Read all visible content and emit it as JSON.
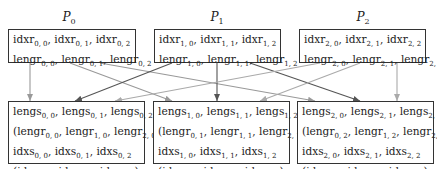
{
  "processes": [
    {
      "name": "P",
      "sub": "0",
      "top_lines": [
        [
          [
            "idxr",
            "0, 0"
          ],
          [
            "idxr",
            "0, 1"
          ],
          [
            "idxr",
            "0, 2"
          ]
        ],
        [
          [
            "lengr",
            "0, 0"
          ],
          [
            "lengr",
            "0, 1"
          ],
          [
            "lengr",
            "0, 2"
          ]
        ]
      ],
      "bottom_lines": [
        {
          "paren": false,
          "items": [
            [
              "lengs",
              "0, 0"
            ],
            [
              "lengs",
              "0, 1"
            ],
            [
              "lengs",
              "0, 2"
            ]
          ]
        },
        {
          "paren": true,
          "items": [
            [
              "lengr",
              "0, 0"
            ],
            [
              "lengr",
              "1, 0"
            ],
            [
              "lengr",
              "2, 0"
            ]
          ]
        },
        {
          "paren": false,
          "items": [
            [
              "idxs",
              "0, 0"
            ],
            [
              "idxs",
              "0, 1"
            ],
            [
              "idxs",
              "0, 2"
            ]
          ]
        },
        {
          "paren": true,
          "items": [
            [
              "idxr",
              "0, 0"
            ],
            [
              "idxr",
              "1, 0"
            ],
            [
              "idxr",
              "2, 0"
            ]
          ]
        }
      ]
    },
    {
      "name": "P",
      "sub": "1",
      "top_lines": [
        [
          [
            "idxr",
            "1, 0"
          ],
          [
            "idxr",
            "1, 1"
          ],
          [
            "idxr",
            "1, 2"
          ]
        ],
        [
          [
            "lengr",
            "1, 0"
          ],
          [
            "lengr",
            "1, 1"
          ],
          [
            "lengr",
            "1, 2"
          ]
        ]
      ],
      "bottom_lines": [
        {
          "paren": false,
          "items": [
            [
              "lengs",
              "1, 0"
            ],
            [
              "lengs",
              "1, 1"
            ],
            [
              "lengs",
              "1, 2"
            ]
          ]
        },
        {
          "paren": true,
          "items": [
            [
              "lengr",
              "0, 1"
            ],
            [
              "lengr",
              "1, 1"
            ],
            [
              "lengr",
              "2, 1"
            ]
          ]
        },
        {
          "paren": false,
          "items": [
            [
              "idxs",
              "1, 0"
            ],
            [
              "idxs",
              "1, 1"
            ],
            [
              "idxs",
              "1, 2"
            ]
          ]
        },
        {
          "paren": true,
          "items": [
            [
              "idxr",
              "0, 1"
            ],
            [
              "idxr",
              "1, 1"
            ],
            [
              "idxr",
              "2, 1"
            ]
          ]
        }
      ]
    },
    {
      "name": "P",
      "sub": "2",
      "top_lines": [
        [
          [
            "idxr",
            "2, 0"
          ],
          [
            "idxr",
            "2, 1"
          ],
          [
            "idxr",
            "2, 2"
          ]
        ],
        [
          [
            "lengr",
            "2, 0"
          ],
          [
            "lengr",
            "2, 1"
          ],
          [
            "lengr",
            "2, 2"
          ]
        ]
      ],
      "bottom_lines": [
        {
          "paren": false,
          "items": [
            [
              "lengs",
              "2, 0"
            ],
            [
              "lengs",
              "2, 1"
            ],
            [
              "lengs",
              "2, 2"
            ]
          ]
        },
        {
          "paren": true,
          "items": [
            [
              "lengr",
              "0, 2"
            ],
            [
              "lengr",
              "1, 2"
            ],
            [
              "lengr",
              "2, 2"
            ]
          ]
        },
        {
          "paren": false,
          "items": [
            [
              "idxs",
              "2, 0"
            ],
            [
              "idxs",
              "2, 1"
            ],
            [
              "idxs",
              "2, 2"
            ]
          ]
        },
        {
          "paren": true,
          "items": [
            [
              "idxr",
              "0, 2"
            ],
            [
              "idxr",
              "1, 2"
            ],
            [
              "idxr",
              "2, 2"
            ]
          ]
        }
      ]
    }
  ],
  "arrows": [
    {
      "from": 0,
      "x1": 30,
      "x2": 30,
      "color": "#999999"
    },
    {
      "from": 0,
      "x1": 70,
      "x2": 172,
      "color": "#999999"
    },
    {
      "from": 0,
      "x1": 100,
      "x2": 315,
      "color": "#999999"
    },
    {
      "from": 1,
      "x1": 172,
      "x2": 75,
      "color": "#555555"
    },
    {
      "from": 1,
      "x1": 217,
      "x2": 217,
      "color": "#555555"
    },
    {
      "from": 1,
      "x1": 250,
      "x2": 360,
      "color": "#555555"
    },
    {
      "from": 2,
      "x1": 320,
      "x2": 115,
      "color": "#aaaaaa"
    },
    {
      "from": 2,
      "x1": 360,
      "x2": 260,
      "color": "#aaaaaa"
    },
    {
      "from": 2,
      "x1": 397,
      "x2": 397,
      "color": "#aaaaaa"
    }
  ]
}
